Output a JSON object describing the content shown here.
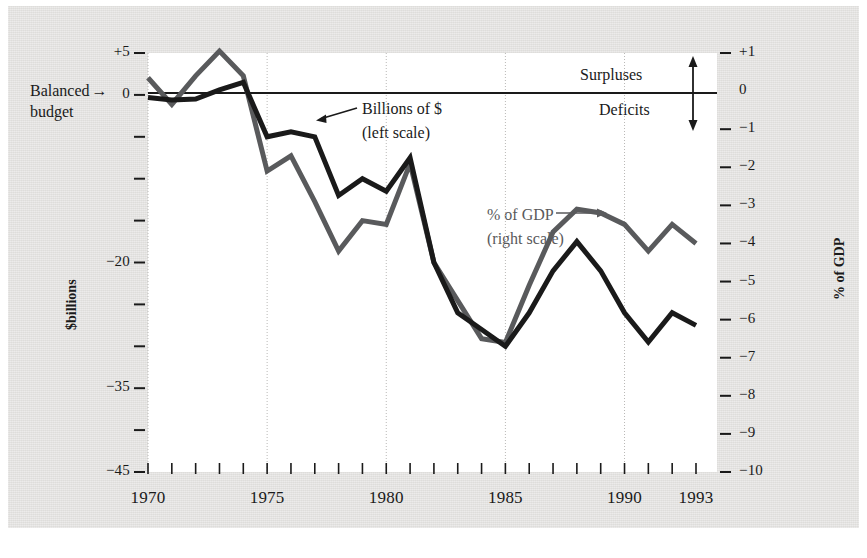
{
  "figure": {
    "background_color": "#e3e2e0",
    "plot_background_color": "#ffffff"
  },
  "annotations": {
    "balanced_line1": "Balanced",
    "balanced_line2": "budget",
    "balanced_arrow": "→",
    "series_black_line1": "Billions of $",
    "series_black_line2": "(left scale)",
    "series_gray_line1": "% of GDP",
    "series_gray_line2": "(right scale)",
    "surpluses": "Surpluses",
    "deficits": "Deficits"
  },
  "axes": {
    "left_title": "$billions",
    "right_title": "% of GDP",
    "left_ticks": [
      {
        "value": 5,
        "label": "+5"
      },
      {
        "value": 0,
        "label": "0"
      },
      {
        "value": -5,
        "label": ""
      },
      {
        "value": -10,
        "label": ""
      },
      {
        "value": -15,
        "label": ""
      },
      {
        "value": -20,
        "label": "−20"
      },
      {
        "value": -25,
        "label": ""
      },
      {
        "value": -30,
        "label": ""
      },
      {
        "value": -35,
        "label": "−35"
      },
      {
        "value": -40,
        "label": ""
      },
      {
        "value": -45,
        "label": "−45"
      }
    ],
    "right_ticks": [
      {
        "value": 1,
        "label": "+1"
      },
      {
        "value": 0,
        "label": "0"
      },
      {
        "value": -1,
        "label": "−1"
      },
      {
        "value": -2,
        "label": "−2"
      },
      {
        "value": -3,
        "label": "−3"
      },
      {
        "value": -4,
        "label": "−4"
      },
      {
        "value": -5,
        "label": "−5"
      },
      {
        "value": -6,
        "label": "−6"
      },
      {
        "value": -7,
        "label": "−7"
      },
      {
        "value": -8,
        "label": "−8"
      },
      {
        "value": -9,
        "label": "−9"
      },
      {
        "value": -10,
        "label": "−10"
      }
    ],
    "x_tick_labels": [
      {
        "year": 1970,
        "label": "1970"
      },
      {
        "year": 1975,
        "label": "1975"
      },
      {
        "year": 1980,
        "label": "1980"
      },
      {
        "year": 1985,
        "label": "1985"
      },
      {
        "year": 1990,
        "label": "1990"
      },
      {
        "year": 1993,
        "label": "1993"
      }
    ],
    "gridline_years": [
      1970,
      1975,
      1980,
      1985,
      1990
    ]
  },
  "chart_data": {
    "type": "line",
    "title": "",
    "xlabel": "",
    "ylabel": "$billions",
    "y2label": "% of GDP",
    "grid": true,
    "legend": "inline-annotations",
    "xlim": [
      1970,
      1993
    ],
    "ylim": [
      -45,
      5
    ],
    "y2lim": [
      -10,
      1
    ],
    "x": [
      1970,
      1971,
      1972,
      1973,
      1974,
      1975,
      1976,
      1977,
      1978,
      1979,
      1980,
      1981,
      1982,
      1983,
      1984,
      1985,
      1986,
      1987,
      1988,
      1989,
      1990,
      1991,
      1992,
      1993
    ],
    "series": [
      {
        "name": "Billions of $",
        "axis": "left",
        "color": "#1a1a1a",
        "values": [
          -0.3,
          -0.6,
          -0.5,
          0.6,
          1.5,
          -5.0,
          -4.4,
          -5.0,
          -12.0,
          -10.0,
          -11.5,
          -7.5,
          -20.0,
          -26.0,
          -28.0,
          -30.0,
          -26.0,
          -21.0,
          -17.5,
          -21.0,
          -26.0,
          -29.5,
          -26.0,
          -27.5
        ]
      },
      {
        "name": "% of GDP",
        "axis": "right",
        "color": "#595a5c",
        "values": [
          0.35,
          -0.35,
          0.4,
          1.05,
          0.4,
          -2.1,
          -1.7,
          -2.9,
          -4.2,
          -3.4,
          -3.5,
          -1.9,
          -4.5,
          -5.5,
          -6.5,
          -6.6,
          -5.1,
          -3.7,
          -3.1,
          -3.2,
          -3.5,
          -4.2,
          -3.5,
          -4.0
        ]
      }
    ]
  }
}
